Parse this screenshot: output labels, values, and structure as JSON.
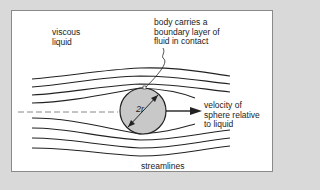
{
  "diagram": {
    "labels": {
      "viscous_liquid": "viscous\nliquid",
      "boundary_layer": "body carries a\nboundary layer of\nfluid in contact",
      "velocity": "velocity of\nsphere relative\nto liquid",
      "streamlines": "streamlines",
      "diameter": "2r",
      "b_marker": "B"
    },
    "colors": {
      "background": "#d9d9d9",
      "panel": "#ffffff",
      "sphere_fill": "#c8c8c8",
      "line": "#222222",
      "dashed": "#888888"
    }
  }
}
